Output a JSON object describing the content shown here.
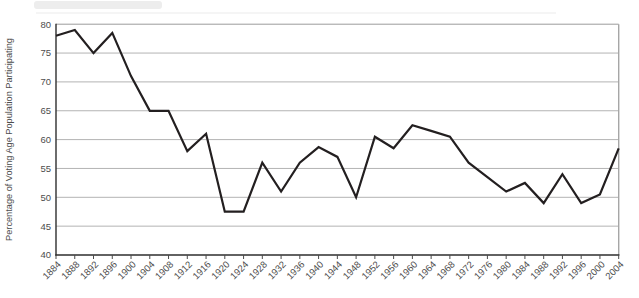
{
  "chart_data": {
    "type": "line",
    "title": "",
    "xlabel": "",
    "ylabel": "Percentage of Voting Age Population Participating",
    "x": [
      1884,
      1888,
      1892,
      1896,
      1900,
      1904,
      1908,
      1912,
      1916,
      1920,
      1924,
      1928,
      1932,
      1936,
      1940,
      1944,
      1948,
      1952,
      1956,
      1960,
      1964,
      1968,
      1972,
      1976,
      1980,
      1984,
      1988,
      1992,
      1996,
      2000,
      2004
    ],
    "values": [
      78,
      79,
      75,
      78.5,
      71,
      65,
      65,
      58,
      61,
      47.5,
      47.5,
      56,
      51,
      56,
      58.7,
      57,
      50,
      60.5,
      58.5,
      62.5,
      61.5,
      60.5,
      56,
      53.5,
      51,
      52.5,
      49,
      54,
      49,
      50.5,
      58.5
    ],
    "ylim": [
      40,
      80
    ],
    "ytick_step": 5,
    "xtick_step_years": 4,
    "grid": "horizontal",
    "legend": "none",
    "line_color": "#231f20",
    "grid_color": "#b3b3b3",
    "border_color": "#a6a6a6",
    "axis_color": "#2e2e2e",
    "tick_color": "#4a4a4a",
    "label_color": "#4d4d4d"
  }
}
